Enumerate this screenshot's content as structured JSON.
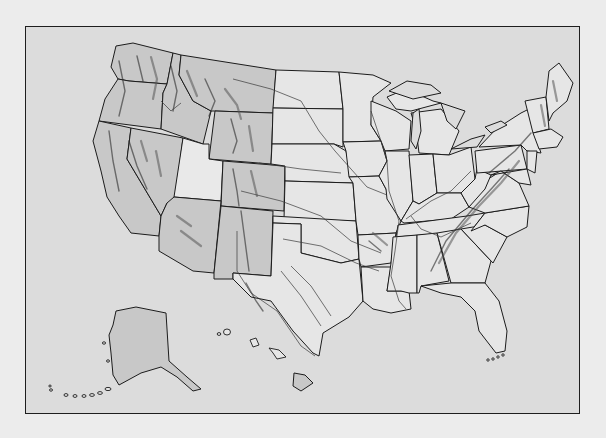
{
  "map": {
    "subject": "United States physical relief map",
    "labels_visible": false,
    "colors": {
      "page_background": "#ececec",
      "map_background": "#dcdcdc",
      "frame_border": "#1e1e1e",
      "land": "#e6e6e6",
      "relief_shading": "#c8c8c8",
      "outline": "#1c1c1c",
      "rivers": "#3a3a3a"
    },
    "features": [
      {
        "name": "contiguous-us",
        "type": "landmass"
      },
      {
        "name": "alaska-inset",
        "type": "landmass"
      },
      {
        "name": "hawaii-inset",
        "type": "island-chain"
      },
      {
        "name": "great-lakes",
        "type": "water"
      },
      {
        "name": "rocky-mountains",
        "type": "relief"
      },
      {
        "name": "sierra-nevada",
        "type": "relief"
      },
      {
        "name": "cascade-range",
        "type": "relief"
      },
      {
        "name": "appalachian-mountains",
        "type": "relief"
      },
      {
        "name": "ozark-plateau",
        "type": "relief"
      },
      {
        "name": "major-rivers",
        "type": "hydrography"
      },
      {
        "name": "state-boundaries",
        "type": "boundary"
      }
    ]
  }
}
